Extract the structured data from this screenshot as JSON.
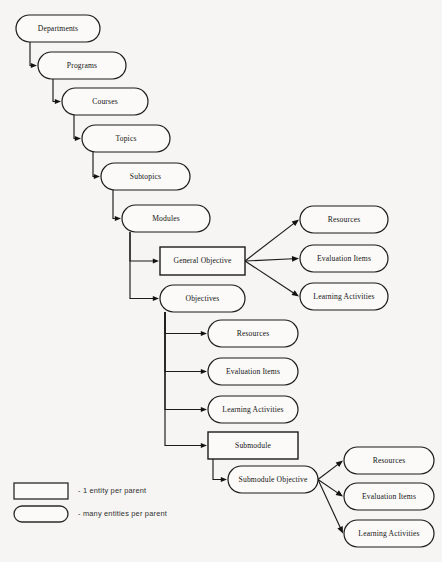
{
  "diagram": {
    "background_color": "#f6f5f3",
    "line_color": "#1b1b1b",
    "nodes": [
      {
        "id": "departments",
        "label": "Departments",
        "shape": "rounded",
        "x": 16,
        "y": 15,
        "w": 84,
        "h": 27
      },
      {
        "id": "programs",
        "label": "Programs",
        "shape": "rounded",
        "x": 38,
        "y": 52,
        "w": 88,
        "h": 27
      },
      {
        "id": "courses",
        "label": "Courses",
        "shape": "rounded",
        "x": 62,
        "y": 88,
        "w": 86,
        "h": 27
      },
      {
        "id": "topics",
        "label": "Topics",
        "shape": "rounded",
        "x": 82,
        "y": 125,
        "w": 88,
        "h": 27
      },
      {
        "id": "subtopics",
        "label": "Subtopics",
        "shape": "rounded",
        "x": 101,
        "y": 163,
        "w": 89,
        "h": 27
      },
      {
        "id": "modules",
        "label": "Modules",
        "shape": "rounded",
        "x": 122,
        "y": 205,
        "w": 88,
        "h": 27
      },
      {
        "id": "general-objective",
        "label": "General Objective",
        "shape": "rectangle",
        "x": 160,
        "y": 247,
        "w": 85,
        "h": 28
      },
      {
        "id": "objectives",
        "label": "Objectives",
        "shape": "rounded",
        "x": 160,
        "y": 285,
        "w": 85,
        "h": 27
      },
      {
        "id": "go-resources",
        "label": "Resources",
        "shape": "rounded",
        "x": 300,
        "y": 206,
        "w": 88,
        "h": 27
      },
      {
        "id": "go-evaluation",
        "label": "Evaluation Items",
        "shape": "rounded",
        "x": 300,
        "y": 245,
        "w": 88,
        "h": 27
      },
      {
        "id": "go-learning",
        "label": "Learning  Activities",
        "shape": "rounded",
        "x": 300,
        "y": 283,
        "w": 88,
        "h": 27
      },
      {
        "id": "obj-resources",
        "label": "Resources",
        "shape": "rounded",
        "x": 208,
        "y": 320,
        "w": 90,
        "h": 27
      },
      {
        "id": "obj-evaluation",
        "label": "Evaluation Items",
        "shape": "rounded",
        "x": 208,
        "y": 358,
        "w": 90,
        "h": 27
      },
      {
        "id": "obj-learning",
        "label": "Learning Activities",
        "shape": "rounded",
        "x": 208,
        "y": 396,
        "w": 90,
        "h": 27
      },
      {
        "id": "submodule",
        "label": "Submodule",
        "shape": "rectangle",
        "x": 208,
        "y": 432,
        "w": 90,
        "h": 27
      },
      {
        "id": "submodule-objective",
        "label": "Submodule Objective",
        "shape": "rounded",
        "x": 228,
        "y": 466,
        "w": 90,
        "h": 27
      },
      {
        "id": "sub-resources",
        "label": "Resources",
        "shape": "rounded",
        "x": 344,
        "y": 447,
        "w": 90,
        "h": 27
      },
      {
        "id": "sub-evaluation",
        "label": "Evaluation Items",
        "shape": "rounded",
        "x": 344,
        "y": 483,
        "w": 90,
        "h": 27
      },
      {
        "id": "sub-learning",
        "label": "Learning Activities",
        "shape": "rounded",
        "x": 344,
        "y": 520,
        "w": 90,
        "h": 27
      }
    ],
    "connectors": [
      {
        "id": "departments-to-programs",
        "type": "elbow",
        "from": "departments",
        "to": "programs",
        "drop_x": 30,
        "arrow_dir": "right"
      },
      {
        "id": "programs-to-courses",
        "type": "elbow",
        "from": "programs",
        "to": "courses",
        "drop_x": 53,
        "arrow_dir": "right"
      },
      {
        "id": "courses-to-topics",
        "type": "elbow",
        "from": "courses",
        "to": "topics",
        "drop_x": 74,
        "arrow_dir": "right"
      },
      {
        "id": "topics-to-subtopics",
        "type": "elbow",
        "from": "topics",
        "to": "subtopics",
        "drop_x": 93,
        "arrow_dir": "right"
      },
      {
        "id": "subtopics-to-modules",
        "type": "elbow",
        "from": "subtopics",
        "to": "modules",
        "drop_x": 113,
        "arrow_dir": "right"
      },
      {
        "id": "modules-to-general",
        "type": "elbow",
        "from": "modules",
        "to": "general-objective",
        "drop_x": 130,
        "arrow_dir": "right"
      },
      {
        "id": "modules-to-objectives",
        "type": "elbow",
        "from": "modules",
        "to": "objectives",
        "drop_x": 130,
        "arrow_dir": "right"
      },
      {
        "id": "general-to-resources",
        "type": "fan",
        "from": "general-objective",
        "to": "go-resources"
      },
      {
        "id": "general-to-evaluation",
        "type": "fan",
        "from": "general-objective",
        "to": "go-evaluation"
      },
      {
        "id": "general-to-learning",
        "type": "fan",
        "from": "general-objective",
        "to": "go-learning"
      },
      {
        "id": "objectives-to-resources",
        "type": "elbow",
        "from": "objectives",
        "to": "obj-resources",
        "drop_x": 165,
        "arrow_dir": "right"
      },
      {
        "id": "objectives-to-evaluation",
        "type": "elbow",
        "from": "objectives",
        "to": "obj-evaluation",
        "drop_x": 165,
        "arrow_dir": "right"
      },
      {
        "id": "objectives-to-learning",
        "type": "elbow",
        "from": "objectives",
        "to": "obj-learning",
        "drop_x": 165,
        "arrow_dir": "right"
      },
      {
        "id": "objectives-to-submodule",
        "type": "elbow",
        "from": "objectives",
        "to": "submodule",
        "drop_x": 165,
        "arrow_dir": "right"
      },
      {
        "id": "submodule-to-subobjective",
        "type": "elbow",
        "from": "submodule",
        "to": "submodule-objective",
        "drop_x": 213,
        "arrow_dir": "right"
      },
      {
        "id": "subobjective-to-resources",
        "type": "fan",
        "from": "submodule-objective",
        "to": "sub-resources"
      },
      {
        "id": "subobjective-to-evaluation",
        "type": "fan",
        "from": "submodule-objective",
        "to": "sub-evaluation"
      },
      {
        "id": "subobjective-to-learning",
        "type": "fan",
        "from": "submodule-objective",
        "to": "sub-learning"
      }
    ]
  },
  "legend": {
    "items": [
      {
        "id": "legend-one-per-parent",
        "shape": "rectangle",
        "text": "- 1 entity per parent",
        "x": 14,
        "y": 483,
        "w": 54,
        "h": 16,
        "text_x": 78
      },
      {
        "id": "legend-many-per-parent",
        "shape": "rounded",
        "text": "- many entities per parent",
        "x": 14,
        "y": 506,
        "w": 54,
        "h": 16,
        "text_x": 78
      }
    ]
  }
}
